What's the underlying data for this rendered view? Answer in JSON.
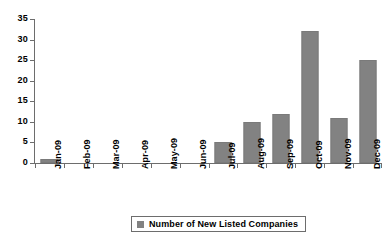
{
  "chart_data": {
    "type": "bar",
    "title": "",
    "subtitle": "",
    "xlabel": "",
    "ylabel": "",
    "categories": [
      "Jan-09",
      "Feb-09",
      "Mar-09",
      "Apr-09",
      "May-09",
      "Jun-09",
      "Jul-09",
      "Aug-09",
      "Sep-09",
      "Oct-09",
      "Nov-09",
      "Dec-09"
    ],
    "values": [
      1,
      0,
      0,
      0,
      0,
      0,
      5,
      10,
      12,
      32,
      11,
      25
    ],
    "series": [
      {
        "name": "Number of New Listed Companies",
        "values": [
          1,
          0,
          0,
          0,
          0,
          0,
          5,
          10,
          12,
          32,
          11,
          25
        ]
      }
    ],
    "ylim": [
      0,
      35
    ],
    "ytick_labels": [
      "35",
      "30",
      "25",
      "20",
      "15",
      "10",
      "5",
      "0"
    ],
    "ytick_values": [
      35,
      30,
      25,
      20,
      15,
      10,
      5,
      0
    ],
    "grid": false,
    "legend_position": "bottom",
    "bar_color": "#828282",
    "axis_color": "#6d6d6d",
    "background_color": "#ffffff"
  },
  "legend": {
    "entries": [
      {
        "label": "Number of New Listed Companies",
        "color": "#828282"
      }
    ]
  }
}
